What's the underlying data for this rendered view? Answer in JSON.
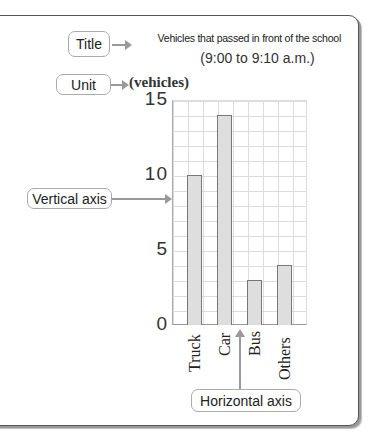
{
  "chart_data": {
    "type": "bar",
    "title": "Vehicles that passed in front of the school",
    "subtitle": "(9:00 to 9:10 a.m.)",
    "unit": "(vehicles)",
    "xlabel": "",
    "ylabel": "(vehicles)",
    "categories": [
      "Truck",
      "Car",
      "Bus",
      "Others"
    ],
    "values": [
      10,
      14,
      3,
      4
    ],
    "ylim": [
      0,
      15
    ],
    "yticks": [
      0,
      5,
      10,
      15
    ],
    "grid": true,
    "bar_fill": "#dedede",
    "bar_edge": "#777777"
  },
  "annotations": {
    "title_label": "Title",
    "unit_label": "Unit",
    "vertical_axis_label": "Vertical axis",
    "horizontal_axis_label": "Horizontal axis"
  }
}
